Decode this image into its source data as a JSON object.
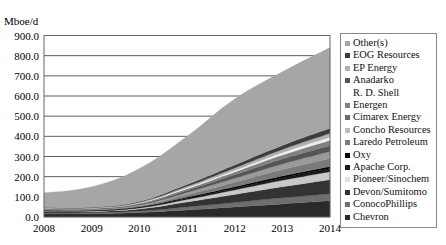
{
  "chart_data": {
    "type": "area",
    "stacked": true,
    "title": "",
    "ylabel": "Mboe/d",
    "xlabel": "",
    "x": [
      "2008",
      "2009",
      "2010",
      "2011",
      "2012",
      "2013",
      "2014"
    ],
    "ylim": [
      0,
      900
    ],
    "yticks": [
      "0.0",
      "100.0",
      "200.0",
      "300.0",
      "400.0",
      "500.0",
      "600.0",
      "700.0",
      "800.0",
      "900.0"
    ],
    "grid": true,
    "legend_position": "right",
    "series": [
      {
        "name": "Chevron",
        "color": "#2a2a2a",
        "values": [
          15,
          16,
          22,
          35,
          50,
          65,
          80
        ]
      },
      {
        "name": "ConocoPhillips",
        "color": "#6e6e6e",
        "values": [
          5,
          5,
          8,
          15,
          22,
          30,
          35
        ]
      },
      {
        "name": "Devon/Sumitomo",
        "color": "#333333",
        "values": [
          6,
          6,
          10,
          25,
          40,
          55,
          70
        ]
      },
      {
        "name": "Pioneer/Sinochem",
        "color": "#c8c8c8",
        "values": [
          3,
          3,
          5,
          12,
          22,
          32,
          40
        ]
      },
      {
        "name": "Apache Corp.",
        "color": "#1a1a1a",
        "values": [
          2,
          2,
          3,
          6,
          9,
          12,
          15
        ]
      },
      {
        "name": "Oxy",
        "color": "#000000",
        "values": [
          2,
          2,
          3,
          5,
          7,
          9,
          10
        ]
      },
      {
        "name": "Laredo Petroleum",
        "color": "#7a7a7a",
        "values": [
          2,
          2,
          4,
          12,
          22,
          32,
          40
        ]
      },
      {
        "name": "Concho Resources",
        "color": "#9a9a9a",
        "values": [
          3,
          3,
          5,
          12,
          20,
          28,
          35
        ]
      },
      {
        "name": "Cimarex Energy",
        "color": "#555555",
        "values": [
          2,
          2,
          4,
          10,
          17,
          24,
          30
        ]
      },
      {
        "name": "Energen",
        "color": "#808080",
        "values": [
          2,
          2,
          4,
          8,
          14,
          20,
          25
        ]
      },
      {
        "name": "Anadarko R. D. Shell",
        "color": "#f0f0f0",
        "values": [
          1,
          1,
          2,
          5,
          8,
          12,
          15
        ]
      },
      {
        "name": "EP Energy",
        "color": "#b0b0b0",
        "values": [
          2,
          2,
          3,
          7,
          12,
          16,
          20
        ]
      },
      {
        "name": "EOG Resources",
        "color": "#3c3c3c",
        "values": [
          2,
          2,
          4,
          9,
          15,
          20,
          25
        ]
      },
      {
        "name": "Other(s)",
        "color": "#a6a6a6",
        "values": [
          73,
          102,
          163,
          239,
          327,
          365,
          400
        ]
      }
    ]
  },
  "legend": {
    "items": [
      {
        "label": "Other(s)",
        "color": "#a6a6a6"
      },
      {
        "label": "EOG Resources",
        "color": "#3c3c3c"
      },
      {
        "label": "EP Energy",
        "color": "#b0b0b0"
      },
      {
        "label": "Anadarko",
        "label2": "R. D. Shell",
        "color": "#555555"
      },
      {
        "label": "Energen",
        "color": "#808080"
      },
      {
        "label": "Cimarex Energy",
        "color": "#6a6a6a"
      },
      {
        "label": "Concho Resources",
        "color": "#bdbdbd"
      },
      {
        "label": "Laredo Petroleum",
        "color": "#7a7a7a"
      },
      {
        "label": "Oxy",
        "color": "#000000"
      },
      {
        "label": "Apache Corp.",
        "color": "#1a1a1a"
      },
      {
        "label": "Pioneer/Sinochem",
        "color": "#e0e0e0"
      },
      {
        "label": "Devon/Sumitomo",
        "color": "#333333"
      },
      {
        "label": "ConocoPhillips",
        "color": "#6e6e6e"
      },
      {
        "label": "Chevron",
        "color": "#2a2a2a"
      }
    ]
  }
}
